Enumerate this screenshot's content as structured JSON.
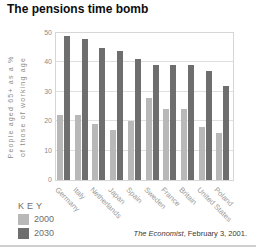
{
  "title": "The pensions time bomb",
  "chart_data": {
    "type": "bar",
    "categories": [
      "Germany",
      "Italy",
      "Netherlands",
      "Japan",
      "Spain",
      "Sweden",
      "France",
      "Britain",
      "United States",
      "Poland"
    ],
    "series": [
      {
        "name": "2000",
        "color": "#b8b8b8",
        "values": [
          22,
          22,
          19,
          17,
          20,
          28,
          24,
          24,
          18,
          16
        ]
      },
      {
        "name": "2030",
        "color": "#6e6e6e",
        "values": [
          49,
          48,
          45,
          44,
          41,
          39,
          39,
          39,
          37,
          32
        ]
      }
    ],
    "title": "The pensions time bomb",
    "xlabel": "",
    "ylabel_line1": "People aged 65+ as a %",
    "ylabel_line2": "of those of working age",
    "ylim": [
      0,
      50
    ],
    "yticks": [
      0,
      10,
      20,
      30,
      40,
      50
    ],
    "grid": true,
    "legend_title": "KEY",
    "legend_position": "bottom-left"
  },
  "legend": {
    "title": "KEY",
    "entries": [
      {
        "label": "2000",
        "color": "#b8b8b8"
      },
      {
        "label": "2030",
        "color": "#6e6e6e"
      }
    ]
  },
  "source": {
    "publication": "The Economist",
    "suffix": ", February 3, 2001."
  },
  "colors": {
    "bar_2000": "#b8b8b8",
    "bar_2030": "#6e6e6e",
    "gridline": "#e0e0e0",
    "plot_border": "#d6d6d6",
    "axis_text": "#8c8c8c",
    "category_text": "#9b9b9b",
    "title_text": "#0d0d0d",
    "bottom_rule": "#cfcfcf",
    "background": "#ffffff"
  }
}
